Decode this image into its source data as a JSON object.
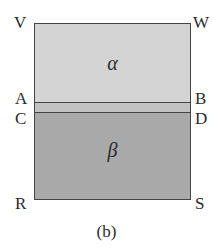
{
  "figure": {
    "caption": "(b)",
    "regions": [
      {
        "id": "alpha",
        "label": "α",
        "fill": "#d4d4d4"
      },
      {
        "id": "interface",
        "label": "",
        "fill": "#c2c2c2"
      },
      {
        "id": "beta",
        "label": "β",
        "fill": "#a9a9a9"
      }
    ],
    "points": {
      "V": "V",
      "W": "W",
      "A": "A",
      "B": "B",
      "C": "C",
      "D": "D",
      "R": "R",
      "S": "S"
    }
  }
}
